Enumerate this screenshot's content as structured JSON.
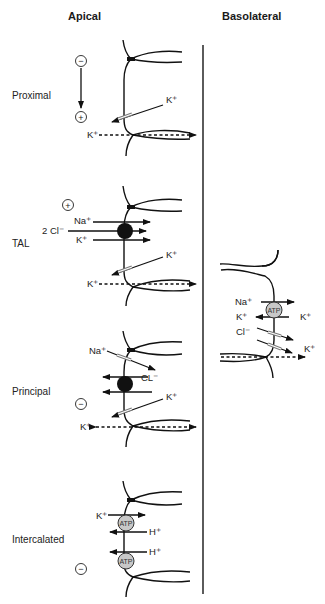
{
  "headers": {
    "apical": "Apical",
    "basolateral": "Basolateral"
  },
  "segments": {
    "proximal": {
      "label": "Proximal",
      "polarity_top": "−",
      "polarity_bottom": "+",
      "ions": {
        "channel": "K⁺",
        "paracellular": "K⁺"
      }
    },
    "tal": {
      "label": "TAL",
      "polarity": "+",
      "ions": {
        "na": "Na⁺",
        "cl": "2 Cl⁻",
        "k": "K⁺",
        "channel": "K⁺",
        "paracellular": "K⁺"
      }
    },
    "principal": {
      "label": "Principal",
      "polarity": "−",
      "ions": {
        "na": "Na⁺",
        "cl": "CL⁻",
        "channel": "K⁺",
        "paracellular": "K⁺"
      }
    },
    "intercalated": {
      "label": "Intercalated",
      "polarity": "−",
      "ions": {
        "k": "K⁺",
        "h1": "H⁺",
        "h2": "H⁺"
      },
      "pump_label": "ATP"
    }
  },
  "basolateral_cell": {
    "pump_label": "ATP",
    "ions": {
      "na": "Na⁺",
      "k_in": "K⁺",
      "k_out": "K⁺",
      "cl": "Cl⁻",
      "k_channel": "K⁺"
    }
  },
  "colors": {
    "line": "#111111",
    "pump_fill": "#c8c8c8",
    "channel": "#777777",
    "divider": "#333333"
  }
}
